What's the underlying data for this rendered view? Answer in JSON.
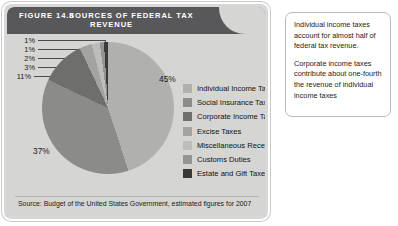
{
  "figure": {
    "figure_number": "FIGURE 14.8",
    "title_line1": "SOURCES  OF  FEDERAL  TAX",
    "title_line2": "REVENUE",
    "source": "Source: Budget of the United States Government, estimated figures for 2007"
  },
  "caption": {
    "paragraph1": "Individual income taxes account for almost half of federal tax revenue.",
    "paragraph2": "Corporate income taxes contribute about one-fourth the revenue of individual income taxes"
  },
  "labels": {
    "pct_individual": "45%",
    "pct_social": "37%",
    "pct_corporate": "11%",
    "pct_excise": "3%",
    "pct_misc": "2%",
    "pct_customs": "1%",
    "pct_estate": "1%"
  },
  "legend": [
    {
      "label": "Individual Income Taxes",
      "color": "#b0b0ae"
    },
    {
      "label": "Social Insurance Taxes",
      "color": "#8b8b89"
    },
    {
      "label": "Corporate Income Taxes",
      "color": "#6e6e6c"
    },
    {
      "label": "Excise Taxes",
      "color": "#a3a3a1"
    },
    {
      "label": "Miscellaneous Receipts",
      "color": "#bdbdbb"
    },
    {
      "label": "Customs Duties",
      "color": "#949492"
    },
    {
      "label": "Estate and Gift Taxes",
      "color": "#3a3a3a"
    }
  ],
  "chart_data": {
    "type": "pie",
    "title": "Sources of Federal Tax Revenue",
    "categories": [
      "Individual Income Taxes",
      "Social Insurance Taxes",
      "Corporate Income Taxes",
      "Excise Taxes",
      "Miscellaneous Receipts",
      "Customs Duties",
      "Estate and Gift Taxes"
    ],
    "values": [
      45,
      37,
      11,
      3,
      2,
      1,
      1
    ],
    "unit": "percent",
    "colors": [
      "#b0b0ae",
      "#8b8b89",
      "#6e6e6c",
      "#a3a3a1",
      "#bdbdbb",
      "#949492",
      "#3a3a3a"
    ],
    "legend_position": "right",
    "grid": false,
    "source": "Budget of the United States Government, estimated figures for 2007",
    "start_angle_deg": 0,
    "direction": "clockwise"
  }
}
